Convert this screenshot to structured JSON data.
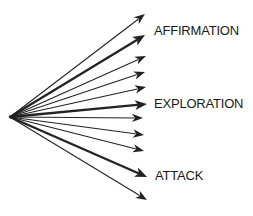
{
  "diagram": {
    "origin": {
      "x": 10,
      "y": 117
    },
    "line_color": "#222222",
    "labels": {
      "affirmation": "AFFIRMATION",
      "exploration": "EXPLORATION",
      "attack": "ATTACK"
    },
    "arrows": [
      {
        "tip_x": 145,
        "tip_y": 14,
        "bold": false
      },
      {
        "tip_x": 145,
        "tip_y": 35,
        "bold": true,
        "label": "AFFIRMATION"
      },
      {
        "tip_x": 146,
        "tip_y": 56,
        "bold": false
      },
      {
        "tip_x": 145,
        "tip_y": 72,
        "bold": false
      },
      {
        "tip_x": 146,
        "tip_y": 87,
        "bold": false
      },
      {
        "tip_x": 147,
        "tip_y": 104,
        "bold": true,
        "label": "EXPLORATION"
      },
      {
        "tip_x": 143,
        "tip_y": 118,
        "bold": false
      },
      {
        "tip_x": 144,
        "tip_y": 135,
        "bold": false
      },
      {
        "tip_x": 144,
        "tip_y": 151,
        "bold": false
      },
      {
        "tip_x": 147,
        "tip_y": 177,
        "bold": true,
        "label": "ATTACK"
      },
      {
        "tip_x": 147,
        "tip_y": 200,
        "bold": false
      }
    ]
  }
}
